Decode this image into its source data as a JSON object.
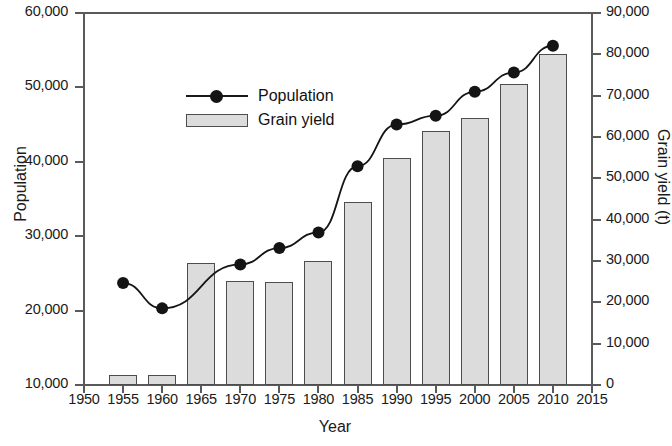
{
  "chart_data": {
    "type": "bar",
    "title": "",
    "xlabel": "Year",
    "ylabel": "Population",
    "y2label": "Grain yield (t)",
    "x": [
      1955,
      1960,
      1965,
      1970,
      1975,
      1980,
      1985,
      1990,
      1995,
      2000,
      2005,
      2010
    ],
    "categories": [
      "1955",
      "1960",
      "1965",
      "1970",
      "1975",
      "1980",
      "1985",
      "1990",
      "1995",
      "2000",
      "2005",
      "2010"
    ],
    "xlim": [
      1950,
      2015
    ],
    "ylim": [
      10000,
      60000
    ],
    "y2lim": [
      0,
      90000
    ],
    "grid": false,
    "legend_position": "upper left",
    "xticklabels": [
      "1950",
      "1955",
      "1960",
      "1965",
      "1970",
      "1975",
      "1980",
      "1985",
      "1990",
      "1995",
      "2000",
      "2005",
      "2010",
      "2015"
    ],
    "xticks": [
      1950,
      1955,
      1960,
      1965,
      1970,
      1975,
      1980,
      1985,
      1990,
      1995,
      2000,
      2005,
      2010,
      2015
    ],
    "yticklabels": [
      "10,000",
      "20,000",
      "30,000",
      "40,000",
      "50,000",
      "60,000"
    ],
    "yticks": [
      10000,
      20000,
      30000,
      40000,
      50000,
      60000
    ],
    "y2ticklabels": [
      "0",
      "10,000",
      "20,000",
      "30,000",
      "40,000",
      "50,000",
      "60,000",
      "70,000",
      "80,000",
      "90,000"
    ],
    "y2ticks": [
      0,
      10000,
      20000,
      30000,
      40000,
      50000,
      60000,
      70000,
      80000,
      90000
    ],
    "series": [
      {
        "name": "Grain yield",
        "type": "bar",
        "axis": "right",
        "units": "t",
        "color": "#dcdcdc",
        "edge_color": "#4d4d4d",
        "values": [
          2500,
          2300,
          29400,
          25100,
          24900,
          30000,
          44200,
          54800,
          61400,
          64500,
          72900,
          80200
        ]
      },
      {
        "name": "Population",
        "type": "line",
        "axis": "left",
        "color": "#141414",
        "marker": "circle",
        "values": [
          23700,
          20300,
          null,
          26200,
          28400,
          30500,
          39400,
          45000,
          46200,
          49400,
          52000,
          55600
        ]
      }
    ]
  }
}
